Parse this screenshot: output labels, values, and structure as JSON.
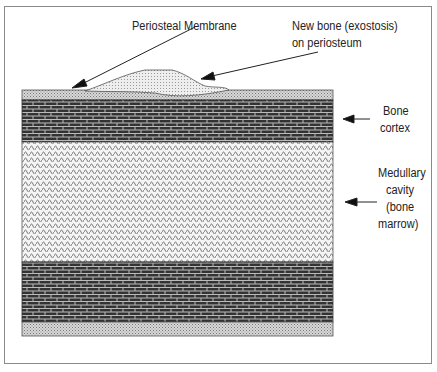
{
  "diagram": {
    "labels": {
      "periosteal_membrane": "Periosteal Membrane",
      "new_bone_line1": "New bone (exostosis)",
      "new_bone_line2": "on periosteum",
      "bone_cortex_line1": "Bone",
      "bone_cortex_line2": "cortex",
      "medullary_line1": "Medullary",
      "medullary_line2": "cavity",
      "medullary_line3": "(bone",
      "medullary_line4": "marrow)"
    },
    "layers": [
      {
        "name": "periosteum-top",
        "pattern": "dotted-light"
      },
      {
        "name": "bone-cortex-top",
        "pattern": "brick-dark"
      },
      {
        "name": "medullary-cavity",
        "pattern": "wavy-light"
      },
      {
        "name": "bone-cortex-bottom",
        "pattern": "brick-dark"
      },
      {
        "name": "periosteum-bottom",
        "pattern": "dotted-light"
      }
    ]
  }
}
